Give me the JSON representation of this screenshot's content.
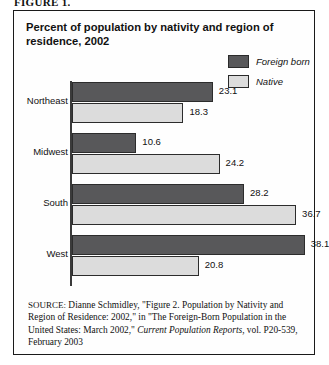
{
  "figure": {
    "caption": "FIGURE 1."
  },
  "chart": {
    "title": "Percent of population by nativity and region of residence, 2002",
    "legend": [
      {
        "label": "Foreign born",
        "color": "#58585a",
        "name": "foreign-born"
      },
      {
        "label": "Native",
        "color": "#dcdcdc",
        "name": "native"
      }
    ]
  },
  "chart_data": {
    "type": "bar",
    "orientation": "horizontal",
    "title": "Percent of population by nativity and region of residence, 2002",
    "xlabel": "",
    "ylabel": "",
    "xlim": [
      0,
      40
    ],
    "grid": false,
    "legend_position": "top-right",
    "categories": [
      "Northeast",
      "Midwest",
      "South",
      "West"
    ],
    "series": [
      {
        "name": "Foreign born",
        "color": "#58585a",
        "values": [
          23.1,
          10.6,
          28.2,
          38.1
        ]
      },
      {
        "name": "Native",
        "color": "#dcdcdc",
        "values": [
          18.3,
          24.2,
          36.7,
          20.8
        ]
      }
    ],
    "data_labels": [
      {
        "category": "Northeast",
        "foreign_born": "23.1",
        "native": "18.3"
      },
      {
        "category": "Midwest",
        "foreign_born": "10.6",
        "native": "24.2"
      },
      {
        "category": "South",
        "foreign_born": "28.2",
        "native": "36.7"
      },
      {
        "category": "West",
        "foreign_born": "38.1",
        "native": "20.8"
      }
    ]
  },
  "source": {
    "prefix": "SOURCE:",
    "text_1": " Dianne Schmidley, \"Figure 2. Population by Nativity and Region of Residence: 2002,\" in \"The Foreign-Born Population in the United States: March 2002,\" ",
    "italic_1": "Current Population Reports",
    "text_2": ", vol. P20-539, February 2003"
  }
}
